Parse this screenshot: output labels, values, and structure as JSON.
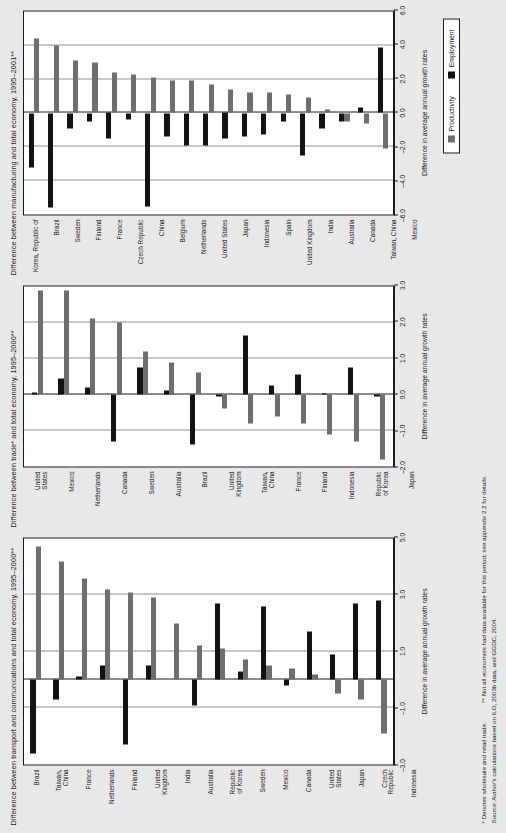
{
  "figure": {
    "notes": {
      "footnote1": "* Denotes wholesale and retail trade.",
      "footnote2": "** Not all economies had data available for this period; see appendix 2.2 for details.",
      "source": "Source: Author's calculations based on ILO, 2003b data, and GGDC, 2004."
    },
    "legend": {
      "productivity_label": "Productivity",
      "employment_label": "Employment",
      "productivity_color": "#6e6e6e",
      "employment_color": "#121212"
    },
    "axis_title": "Difference in average annual growth rates"
  },
  "chart_data": [
    {
      "type": "bar",
      "id": "transport-communications",
      "title": "Difference between transport and communications and total economy, 1995–2000**",
      "xlabel": "Difference in average annual growth rates",
      "ylabel": "",
      "xlim": [
        -3.0,
        5.0
      ],
      "ticks": [
        -3.0,
        -1.0,
        1.0,
        3.0,
        5.0
      ],
      "tick_labels": [
        "–3.0",
        "–1.0",
        "1.0",
        "3.0",
        "5.0"
      ],
      "gridlines": [
        -1.0,
        1.0,
        3.0
      ],
      "grid": true,
      "orientation": "horizontal",
      "legend_position": "bottom-right",
      "categories": [
        "Brazil",
        "Taiwan,\nChina",
        "France",
        "Netherlands",
        "Finland",
        "United\nKingdom",
        "India",
        "Australia",
        "Republic\nof Korea",
        "Sweden",
        "Mexico",
        "Canada",
        "United\nStates",
        "Japan",
        "Czech\nRepublic",
        "Indonesia"
      ],
      "series": [
        {
          "name": "Productivity",
          "color": "#6e6e6e",
          "values": [
            4.7,
            4.2,
            3.6,
            3.2,
            3.1,
            2.9,
            2.0,
            1.2,
            1.1,
            0.7,
            0.5,
            0.4,
            0.2,
            -0.5,
            -0.7,
            -1.9
          ]
        },
        {
          "name": "Employment",
          "color": "#121212",
          "values": [
            -2.6,
            -0.7,
            0.1,
            0.5,
            -2.3,
            0.5,
            0.0,
            -0.9,
            2.7,
            0.3,
            2.6,
            -0.2,
            1.7,
            0.9,
            2.7,
            2.8
          ]
        }
      ]
    },
    {
      "type": "bar",
      "id": "trade-total-economy",
      "title": "Difference between trade* and total economy, 1995–2000**",
      "xlabel": "Difference in average annual growth rates",
      "ylabel": "",
      "xlim": [
        -2.0,
        3.0
      ],
      "ticks": [
        -2.0,
        -1.0,
        0.0,
        1.0,
        2.0,
        3.0
      ],
      "tick_labels": [
        "–2.0",
        "–1.0",
        "0.0",
        "1.0",
        "2.0",
        "3.0"
      ],
      "gridlines": [
        -1.0,
        1.0,
        2.0
      ],
      "grid": true,
      "orientation": "horizontal",
      "legend_position": "bottom-right",
      "categories": [
        "United\nStates",
        "Mexico",
        "Netherlands",
        "Canada",
        "Sweden",
        "Australia",
        "Brazil",
        "United\nKingdom",
        "Taiwan,\nChina",
        "France",
        "Finland",
        "Indonesia",
        "Republic\nof Korea",
        "Japan"
      ],
      "series": [
        {
          "name": "Productivity",
          "color": "#6e6e6e",
          "values": [
            2.9,
            2.9,
            2.1,
            2.0,
            1.2,
            0.9,
            0.6,
            -0.4,
            -0.8,
            -0.6,
            -0.8,
            -1.1,
            -1.3,
            -1.8
          ]
        },
        {
          "name": "Employment",
          "color": "#121212",
          "values": [
            0.05,
            0.45,
            0.2,
            -1.3,
            0.75,
            0.1,
            -1.4,
            -0.05,
            1.65,
            0.25,
            0.55,
            0.02,
            0.75,
            -0.05
          ]
        }
      ]
    },
    {
      "type": "bar",
      "id": "manufacturing-total-economy",
      "title": "Difference between manufacturing and total economy, 1995–2001**",
      "xlabel": "Difference in average annual growth rates",
      "ylabel": "",
      "xlim": [
        -6.0,
        6.0
      ],
      "ticks": [
        -6.0,
        -4.0,
        -2.0,
        0.0,
        2.0,
        4.0,
        6.0
      ],
      "tick_labels": [
        "–6.0",
        "–4.0",
        "–2.0",
        "0.0",
        "2.0",
        "4.0",
        "6.0"
      ],
      "gridlines": [
        -4.0,
        -2.0,
        2.0,
        4.0
      ],
      "grid": true,
      "orientation": "horizontal",
      "legend_position": "bottom-right",
      "categories": [
        "Korea, Republic of",
        "Brazil",
        "Sweden",
        "Finland",
        "France",
        "Czech Republic",
        "China",
        "Belgium",
        "Netherlands",
        "United States",
        "Japan",
        "Indonesia",
        "Spain",
        "United Kingdom",
        "India",
        "Australia",
        "Canada",
        "Taiwan, China",
        "Mexico"
      ],
      "series": [
        {
          "name": "Productivity",
          "color": "#6e6e6e",
          "values": [
            4.4,
            4.0,
            3.1,
            3.0,
            2.4,
            2.3,
            2.1,
            1.9,
            1.9,
            1.7,
            1.4,
            1.2,
            1.2,
            1.1,
            0.9,
            0.2,
            -0.5,
            -0.6,
            -2.1
          ]
        },
        {
          "name": "Employment",
          "color": "#121212",
          "values": [
            -3.2,
            -5.6,
            -0.9,
            -0.5,
            -1.5,
            -0.4,
            -5.5,
            -1.4,
            -1.9,
            -1.9,
            -1.5,
            -1.4,
            -1.3,
            -0.5,
            -2.5,
            -0.9,
            -0.5,
            0.3,
            3.9
          ]
        }
      ]
    }
  ]
}
